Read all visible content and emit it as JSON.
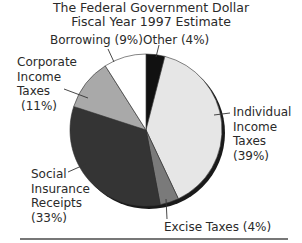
{
  "chart_data": {
    "type": "pie",
    "title": "The Federal Government Dollar",
    "subtitle": "Fiscal Year 1997 Estimate",
    "slices": [
      {
        "label": "Other",
        "value": 4,
        "color": "#111111"
      },
      {
        "label": "Individual Income Taxes",
        "value": 39,
        "color": "#e6e6e6"
      },
      {
        "label": "Excise Taxes",
        "value": 4,
        "color": "#7a7a7a"
      },
      {
        "label": "Social Insurance Receipts",
        "value": 33,
        "color": "#343434"
      },
      {
        "label": "Corporate Income Taxes",
        "value": 11,
        "color": "#a9a9a9"
      },
      {
        "label": "Borrowing",
        "value": 9,
        "color": "#ffffff"
      }
    ],
    "start_angle": "12 o'clock",
    "direction": "clockwise",
    "units": "%"
  },
  "header": {
    "title": "The Federal Government Dollar",
    "subtitle": "Fiscal Year 1997 Estimate"
  },
  "labels": {
    "other": "Other (4%)",
    "borrowing": "Borrowing (9%)",
    "corporate": [
      "Corporate",
      "Income",
      "Taxes",
      "(11%)"
    ],
    "individual": [
      "Individual",
      "Income",
      "Taxes",
      "(39%)"
    ],
    "social": [
      "Social",
      "Insurance",
      "Receipts",
      "(33%)"
    ],
    "excise": "Excise Taxes (4%)"
  }
}
